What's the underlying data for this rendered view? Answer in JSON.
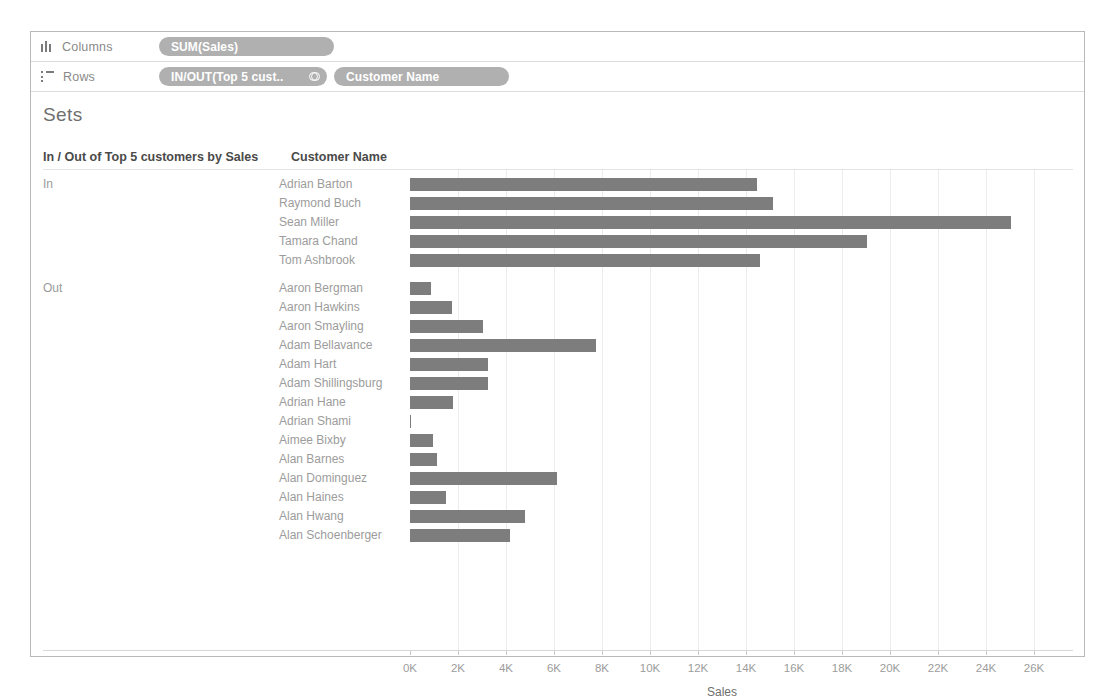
{
  "shelves": {
    "columns": {
      "label": "Columns",
      "icon": "columns-icon",
      "pills": [
        {
          "text": "SUM(Sales)"
        }
      ]
    },
    "rows": {
      "label": "Rows",
      "icon": "rows-icon",
      "pills": [
        {
          "text": "IN/OUT(Top 5 cust..",
          "icon": "set-icon"
        },
        {
          "text": "Customer Name"
        }
      ]
    }
  },
  "sheet": {
    "title": "Sets",
    "header_inout": "In / Out of Top 5 customers by Sales",
    "header_customer": "Customer Name"
  },
  "chart_data": {
    "type": "bar",
    "orientation": "horizontal",
    "title": "Sets",
    "xlabel": "Sales",
    "ylabel": "Customer Name",
    "xlim": [
      0,
      26000
    ],
    "xticks": [
      0,
      2000,
      4000,
      6000,
      8000,
      10000,
      12000,
      14000,
      16000,
      18000,
      20000,
      22000,
      24000,
      26000
    ],
    "xticklabels": [
      "0K",
      "2K",
      "4K",
      "6K",
      "8K",
      "10K",
      "12K",
      "14K",
      "16K",
      "18K",
      "20K",
      "22K",
      "24K",
      "26K"
    ],
    "grid": true,
    "legend": "none",
    "bar_color": "#7d7d7d",
    "groups": [
      {
        "label": "In",
        "rows": [
          {
            "name": "Adrian Barton",
            "value": 14473
          },
          {
            "name": "Raymond Buch",
            "value": 15117
          },
          {
            "name": "Sean Miller",
            "value": 25043
          },
          {
            "name": "Tamara Chand",
            "value": 19052
          },
          {
            "name": "Tom Ashbrook",
            "value": 14596
          }
        ]
      },
      {
        "label": "Out",
        "rows": [
          {
            "name": "Aaron Bergman",
            "value": 887
          },
          {
            "name": "Aaron Hawkins",
            "value": 1744
          },
          {
            "name": "Aaron Smayling",
            "value": 3050
          },
          {
            "name": "Adam Bellavance",
            "value": 7756
          },
          {
            "name": "Adam Hart",
            "value": 3250
          },
          {
            "name": "Adam Shillingsburg",
            "value": 3255
          },
          {
            "name": "Adrian Hane",
            "value": 1778
          },
          {
            "name": "Adrian Shami",
            "value": 58
          },
          {
            "name": "Aimee Bixby",
            "value": 967
          },
          {
            "name": "Alan Barnes",
            "value": 1113
          },
          {
            "name": "Alan Dominguez",
            "value": 6106
          },
          {
            "name": "Alan Haines",
            "value": 1495
          },
          {
            "name": "Alan Hwang",
            "value": 4805
          },
          {
            "name": "Alan Schoenberger",
            "value": 4173
          }
        ]
      }
    ]
  }
}
